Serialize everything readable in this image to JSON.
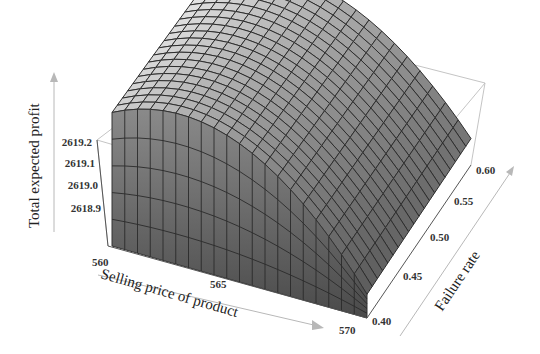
{
  "chart_data": {
    "type": "surface3d",
    "title": "",
    "xlabel": "Selling price of product",
    "ylabel": "Failure rate",
    "zlabel": "Total expected profit",
    "x_ticks": [
      "560",
      "565",
      "570"
    ],
    "y_ticks": [
      "0.40",
      "0.45",
      "0.50",
      "0.55",
      "0.60"
    ],
    "z_ticks": [
      "2618.9",
      "2619.0",
      "2619.1",
      "2619.2"
    ],
    "x_range": [
      560,
      570
    ],
    "y_range": [
      0.4,
      0.6
    ],
    "z_range": [
      2618.85,
      2619.25
    ],
    "sample_grid": {
      "x": [
        560,
        562,
        564,
        566,
        568,
        570
      ],
      "y": [
        0.4,
        0.5,
        0.6
      ],
      "z": [
        [
          2619.12,
          2619.13,
          2619.14
        ],
        [
          2619.21,
          2619.22,
          2619.23
        ],
        [
          2619.18,
          2619.19,
          2619.2
        ],
        [
          2619.08,
          2619.09,
          2619.1
        ],
        [
          2618.98,
          2618.99,
          2619.0
        ],
        [
          2618.88,
          2618.89,
          2618.9
        ]
      ]
    },
    "grid": true,
    "mesh_lines": 20,
    "colormap": "grayscale"
  },
  "labels": {
    "z_axis": "Total expected profit",
    "x_axis": "Selling price of product",
    "y_axis": "Failure rate"
  },
  "ticks": {
    "z": [
      "2619.2",
      "2619.1",
      "2619.0",
      "2618.9"
    ],
    "x": [
      "560",
      "565",
      "570"
    ],
    "y": [
      "0.60",
      "0.55",
      "0.50",
      "0.45",
      "0.40"
    ]
  }
}
